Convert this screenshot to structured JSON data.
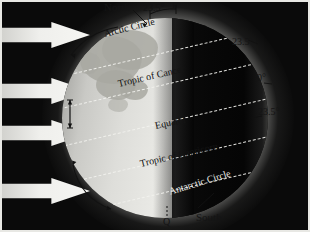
{
  "figure": {
    "background_color": "#0a0a0a",
    "frame_color": "#e8e8e4"
  },
  "sun_rays": {
    "icon": "arrow-right-icon",
    "count": 4,
    "color": "#f2f2ee",
    "direction": "left-to-right"
  },
  "globe": {
    "lit_side": "left",
    "dark_side": "right",
    "lit_color": "#dedeDa",
    "dark_color": "#060606",
    "glow_color": "#ffffff"
  },
  "poles": {
    "north_label": "North",
    "south_label": "South",
    "p_label": "P",
    "q_label": "Q"
  },
  "angles": {
    "tilt_top": "23.5°",
    "right_upper": "23.5°",
    "right_equator": "0°",
    "right_lower": "23.5°"
  },
  "latitudes": [
    {
      "name": "Arctic Circle",
      "label": "Arctic Circle"
    },
    {
      "name": "Tropic of Cancer",
      "label": "Tropic of Cancer"
    },
    {
      "name": "Equator",
      "label": "Equator"
    },
    {
      "name": "Tropic of Capricorn",
      "label": "Tropic of Capricorn"
    },
    {
      "name": "Antarctic Circle",
      "label": "Antarctic Circle"
    }
  ]
}
